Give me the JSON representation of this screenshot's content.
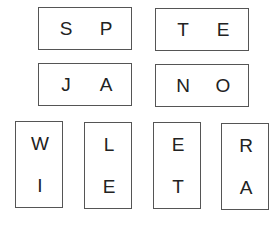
{
  "tiles": [
    {
      "orientation": "horizontal",
      "letters": [
        "S",
        "P"
      ]
    },
    {
      "orientation": "horizontal",
      "letters": [
        "T",
        "E"
      ]
    },
    {
      "orientation": "horizontal",
      "letters": [
        "J",
        "A"
      ]
    },
    {
      "orientation": "horizontal",
      "letters": [
        "N",
        "O"
      ]
    },
    {
      "orientation": "vertical",
      "letters": [
        "W",
        "I"
      ]
    },
    {
      "orientation": "vertical",
      "letters": [
        "L",
        "E"
      ]
    },
    {
      "orientation": "vertical",
      "letters": [
        "E",
        "T"
      ]
    },
    {
      "orientation": "vertical",
      "letters": [
        "R",
        "A"
      ]
    }
  ],
  "colors": {
    "border": "#555555",
    "text": "#222222",
    "background": "#ffffff"
  }
}
